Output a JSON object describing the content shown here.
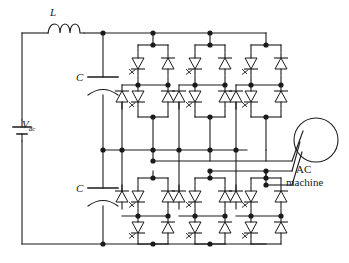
{
  "figure": {
    "kind": "circuit-schematic",
    "stroke_color": "#1a1a1a",
    "background_color": "#ffffff",
    "width": 349,
    "height": 263
  },
  "labels": {
    "inductor": "L",
    "capacitor_top": "C",
    "capacitor_bottom": "C",
    "source": "V",
    "source_sub": "dc",
    "machine_line1": "AC",
    "machine_line2": "machine"
  },
  "components": {
    "dc_source": {
      "name": "V_dc",
      "symbol": "battery",
      "label": "V"
    },
    "inductor": {
      "name": "L",
      "symbol": "coil",
      "turns": 3
    },
    "capacitors": [
      {
        "name": "C",
        "symbol": "curved-plate-capacitor",
        "position": "upper"
      },
      {
        "name": "C",
        "symbol": "curved-plate-capacitor",
        "position": "lower"
      }
    ],
    "phase_legs": [
      {
        "index": 1,
        "x": 153
      },
      {
        "index": 2,
        "x": 210
      },
      {
        "index": 3,
        "x": 266
      }
    ],
    "machine": {
      "type": "AC machine",
      "symbol": "circle",
      "phases": 3
    }
  },
  "rails": {
    "positive_top": 33,
    "mid_upper": 150,
    "mid_lower": 171,
    "negative_bottom": 244
  },
  "device_legend": {
    "thyristor": "triangle-with-gate",
    "diode": "triangle-no-gate"
  }
}
